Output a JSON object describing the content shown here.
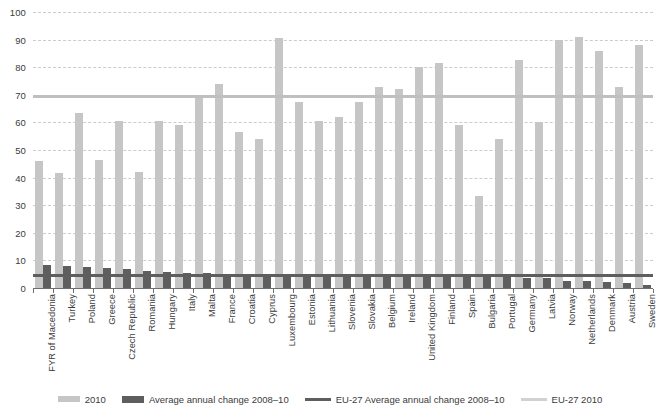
{
  "chart_data": {
    "type": "bar",
    "title": "",
    "xlabel": "",
    "ylabel": "",
    "ylim": [
      0,
      100
    ],
    "grid": true,
    "legend_position": "bottom",
    "categories": [
      "FYR of Macedonia",
      "Turkey",
      "Poland",
      "Greece",
      "Czech Republic",
      "Romania",
      "Hungary",
      "Italy",
      "Malta",
      "France",
      "Croatia",
      "Cyprus",
      "Luxembourg",
      "Estonia",
      "Lithuania",
      "Slovenia",
      "Slovakia",
      "Belgium",
      "Ireland",
      "United Kingdom",
      "Finland",
      "Spain",
      "Bulgaria",
      "Portugal",
      "Germany",
      "Latvia",
      "Norway",
      "Netherlands",
      "Denmark",
      "Austria",
      "Sweden"
    ],
    "yticks": [
      0,
      10,
      20,
      30,
      40,
      50,
      60,
      70,
      80,
      90,
      100
    ],
    "series": [
      {
        "name": "2010",
        "color": "#c6c6c6",
        "values": [
          46,
          41.5,
          63.5,
          46.5,
          60.5,
          42,
          60.5,
          59,
          70,
          74,
          56.5,
          54,
          90.5,
          67.5,
          60.5,
          62,
          67.5,
          73,
          72,
          80,
          81.5,
          59,
          33.5,
          54,
          82.5,
          60,
          90,
          91,
          86,
          73,
          88
        ]
      },
      {
        "name": "Average annual change 2008–10",
        "color": "#5e5e5e",
        "values": [
          8.2,
          7.8,
          7.5,
          7.4,
          7.0,
          6.0,
          5.8,
          5.6,
          5.4,
          5.2,
          5.0,
          4.9,
          4.8,
          4.8,
          4.7,
          4.7,
          4.6,
          4.5,
          4.5,
          4.4,
          4.3,
          4.2,
          4.1,
          4.0,
          3.8,
          3.6,
          2.6,
          2.4,
          2.2,
          1.7,
          1.0
        ]
      }
    ],
    "reference_lines": [
      {
        "name": "EU-27 Average annual change 2008–10",
        "value": 5.0,
        "color": "#5e5e5e"
      },
      {
        "name": "EU-27 2010",
        "value": 70.0,
        "color": "#bfbfbf"
      }
    ]
  },
  "legend": {
    "items": [
      {
        "label": "2010",
        "swatch": "bar2010"
      },
      {
        "label": "Average annual change 2008–10",
        "swatch": "barchange"
      },
      {
        "label": "EU-27 Average annual change 2008–10",
        "swatch": "lineeuchange"
      },
      {
        "label": "EU-27 2010",
        "swatch": "lineeu2010"
      }
    ]
  }
}
